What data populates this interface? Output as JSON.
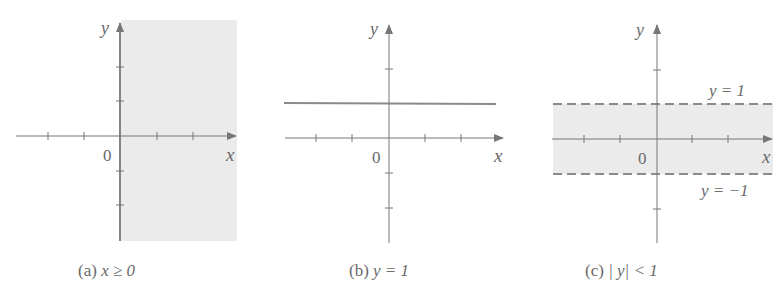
{
  "colors": {
    "axis": "#777777",
    "shade": "#ebebeb",
    "line": "#8a8a8a",
    "text": "#666666"
  },
  "panels": [
    {
      "id": "a",
      "caption_prefix": "(a)",
      "caption_expr": "x ≥ 0",
      "origin_label": "0",
      "x_label": "x",
      "y_label": "y",
      "region": "x ≥ 0 shaded (right half-plane)"
    },
    {
      "id": "b",
      "caption_prefix": "(b)",
      "caption_expr": "y = 1",
      "origin_label": "0",
      "x_label": "x",
      "y_label": "y",
      "region": "horizontal line y = 1"
    },
    {
      "id": "c",
      "caption_prefix": "(c)",
      "caption_expr": "| y| < 1",
      "origin_label": "0",
      "x_label": "x",
      "y_label": "y",
      "upper_label": "y = 1",
      "lower_label": "y = −1",
      "region": "shaded horizontal band between dashed lines y = 1 and y = −1"
    }
  ]
}
